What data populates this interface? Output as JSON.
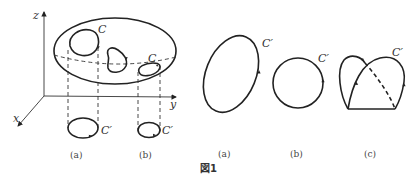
{
  "figure": {
    "caption": "図1",
    "left_panel": {
      "axes": {
        "x": "x",
        "y": "y",
        "z": "z"
      },
      "surface_curves": [
        {
          "label": "C"
        },
        {
          "label": ""
        },
        {
          "label": "C"
        }
      ],
      "projections": [
        {
          "label": "C′",
          "sub_caption": "(a)"
        },
        {
          "label": "C′",
          "sub_caption": "(b)"
        }
      ]
    },
    "right_panels": [
      {
        "label": "C′",
        "sub_caption": "(a)",
        "shape": "ellipse"
      },
      {
        "label": "C′",
        "sub_caption": "(b)",
        "shape": "circle"
      },
      {
        "label": "C′",
        "sub_caption": "(c)",
        "shape": "self-intersecting loop"
      }
    ]
  }
}
